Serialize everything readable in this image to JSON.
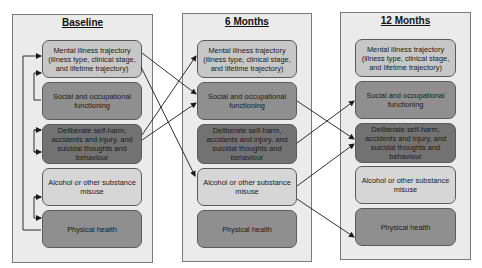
{
  "panels": [
    {
      "title": "Baseline",
      "nodes": [
        {
          "label": "Mental illness trajectory (illness type, clinical stage, and lifetime trajectory)"
        },
        {
          "label": "Social and occupational functioning"
        },
        {
          "label": "Deliberate self-harm, accidents and injury, and suicidal thoughts and behaviour"
        },
        {
          "label": "Alcohol or other substance misuse"
        },
        {
          "label": "Physical health"
        }
      ]
    },
    {
      "title": "6 Months",
      "nodes": [
        {
          "label": "Mental illness trajectory (illness type, clinical stage, and lifetime trajectory)"
        },
        {
          "label": "Social and occupational functioning"
        },
        {
          "label": "Deliberate self-harm, accidents and injury, and suicidal thoughts and behaviour"
        },
        {
          "label": "Alcohol or other substance misuse"
        },
        {
          "label": "Physical health"
        }
      ]
    },
    {
      "title": "12 Months",
      "nodes": [
        {
          "label": "Mental illness trajectory (illness type, clinical stage, and lifetime trajectory)"
        },
        {
          "label": "Social and occupational functioning"
        },
        {
          "label": "Deliberate self-harm, accidents and injury, and suicidal thoughts and behaviour"
        },
        {
          "label": "Alcohol or other substance misuse"
        },
        {
          "label": "Physical health"
        }
      ]
    }
  ],
  "edges": [
    {
      "from": "Baseline: Mental illness trajectory",
      "to": "6 Months: Social and occupational functioning"
    },
    {
      "from": "Baseline: Mental illness trajectory",
      "to": "6 Months: Alcohol or other substance misuse"
    },
    {
      "from": "Baseline: Deliberate self-harm",
      "to": "6 Months: Mental illness trajectory"
    },
    {
      "from": "Baseline: Deliberate self-harm",
      "to": "6 Months: Social and occupational functioning"
    },
    {
      "from": "6 Months: Social and occupational functioning",
      "to": "12 Months: Deliberate self-harm"
    },
    {
      "from": "6 Months: Deliberate self-harm",
      "to": "12 Months: Social and occupational functioning"
    },
    {
      "from": "6 Months: Alcohol or other substance misuse",
      "to": "12 Months: Deliberate self-harm"
    },
    {
      "from": "6 Months: Alcohol or other substance misuse",
      "to": "12 Months: Physical health"
    }
  ],
  "colors": {
    "panel_bg": "#ebebeb",
    "mental_illness": "#c7c7c7",
    "social": "#8f8f8f",
    "self_harm": "#727272",
    "alcohol": "#d6d6d6",
    "physical": "#8f8f8f",
    "arrow": "#1a1a1a"
  }
}
